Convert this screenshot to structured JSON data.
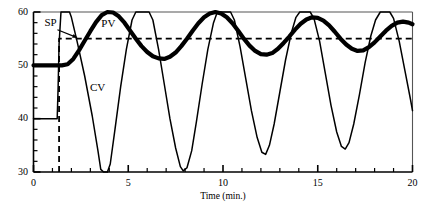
{
  "chart_data": {
    "type": "line",
    "title": "",
    "xlabel": "Time (min.)",
    "ylabel": "",
    "xlim": [
      0,
      20
    ],
    "ylim": [
      30,
      60
    ],
    "grid": false,
    "legend_position": "inline-annotations",
    "x_major_ticks": [
      0,
      5,
      10,
      15,
      20
    ],
    "x_major_tick_labels": [
      "0",
      "5",
      "10",
      "15",
      "20"
    ],
    "x_minor_tick_step": 1,
    "y_major_ticks": [
      30,
      40,
      50,
      60
    ],
    "y_major_tick_labels": [
      "30",
      "40",
      "50",
      "60"
    ],
    "y_minor_tick_step": 2,
    "annotations": [
      {
        "text": "SP",
        "x": 1.0,
        "y": 57.8,
        "arrow_to_x": 2.3,
        "arrow_to_y": 55.0
      },
      {
        "text": "PV",
        "x": 4.0,
        "y": 57.6
      },
      {
        "text": "CV",
        "x": 3.4,
        "y": 45.5
      }
    ],
    "series": [
      {
        "name": "SP",
        "style": "dashed",
        "width": 1.8,
        "color": "#000000",
        "points": [
          [
            1.35,
            30.0
          ],
          [
            1.35,
            55.0
          ],
          [
            20.0,
            55.0
          ]
        ]
      },
      {
        "name": "PV",
        "style": "solid-thick",
        "width": 4.2,
        "color": "#000000",
        "points": [
          [
            0.0,
            50.0
          ],
          [
            1.0,
            50.0
          ],
          [
            1.5,
            50.0
          ],
          [
            1.8,
            50.2
          ],
          [
            2.1,
            51.2
          ],
          [
            2.4,
            52.8
          ],
          [
            2.7,
            54.6
          ],
          [
            3.0,
            56.4
          ],
          [
            3.3,
            58.1
          ],
          [
            3.6,
            59.4
          ],
          [
            3.9,
            60.0
          ],
          [
            4.2,
            59.9
          ],
          [
            4.5,
            59.2
          ],
          [
            4.8,
            58.0
          ],
          [
            5.1,
            56.5
          ],
          [
            5.4,
            55.0
          ],
          [
            5.7,
            53.6
          ],
          [
            6.0,
            52.5
          ],
          [
            6.3,
            51.7
          ],
          [
            6.6,
            51.3
          ],
          [
            6.9,
            51.2
          ],
          [
            7.2,
            51.6
          ],
          [
            7.5,
            52.4
          ],
          [
            7.8,
            53.6
          ],
          [
            8.1,
            55.0
          ],
          [
            8.4,
            56.5
          ],
          [
            8.7,
            57.9
          ],
          [
            9.0,
            59.0
          ],
          [
            9.3,
            59.7
          ],
          [
            9.6,
            60.0
          ],
          [
            9.9,
            59.7
          ],
          [
            10.2,
            59.0
          ],
          [
            10.5,
            57.9
          ],
          [
            10.8,
            56.5
          ],
          [
            11.1,
            55.0
          ],
          [
            11.4,
            53.7
          ],
          [
            11.7,
            52.7
          ],
          [
            12.0,
            52.1
          ],
          [
            12.3,
            52.0
          ],
          [
            12.6,
            52.3
          ],
          [
            12.9,
            53.1
          ],
          [
            13.2,
            54.2
          ],
          [
            13.5,
            55.4
          ],
          [
            13.8,
            56.7
          ],
          [
            14.1,
            57.8
          ],
          [
            14.4,
            58.6
          ],
          [
            14.7,
            59.0
          ],
          [
            15.0,
            58.9
          ],
          [
            15.3,
            58.4
          ],
          [
            15.6,
            57.5
          ],
          [
            15.9,
            56.3
          ],
          [
            16.2,
            55.0
          ],
          [
            16.5,
            53.9
          ],
          [
            16.8,
            53.1
          ],
          [
            17.1,
            52.7
          ],
          [
            17.4,
            52.8
          ],
          [
            17.7,
            53.4
          ],
          [
            18.0,
            54.3
          ],
          [
            18.3,
            55.4
          ],
          [
            18.6,
            56.5
          ],
          [
            18.9,
            57.4
          ],
          [
            19.2,
            58.0
          ],
          [
            19.5,
            58.2
          ],
          [
            19.8,
            58.0
          ],
          [
            20.0,
            57.7
          ]
        ]
      },
      {
        "name": "CV",
        "style": "solid-thin",
        "width": 1.5,
        "color": "#000000",
        "points": [
          [
            0.0,
            40.0
          ],
          [
            1.25,
            40.0
          ],
          [
            1.3,
            46.0
          ],
          [
            1.35,
            54.0
          ],
          [
            1.45,
            60.0
          ],
          [
            1.9,
            60.0
          ],
          [
            2.0,
            59.0
          ],
          [
            2.3,
            54.5
          ],
          [
            2.7,
            48.0
          ],
          [
            3.1,
            40.5
          ],
          [
            3.4,
            34.0
          ],
          [
            3.55,
            30.5
          ],
          [
            3.7,
            30.0
          ],
          [
            3.9,
            30.0
          ],
          [
            4.05,
            31.5
          ],
          [
            4.3,
            38.0
          ],
          [
            4.6,
            46.0
          ],
          [
            4.9,
            53.0
          ],
          [
            5.2,
            58.5
          ],
          [
            5.4,
            60.0
          ],
          [
            6.1,
            60.0
          ],
          [
            6.3,
            58.5
          ],
          [
            6.6,
            53.0
          ],
          [
            6.9,
            46.5
          ],
          [
            7.2,
            40.0
          ],
          [
            7.5,
            34.5
          ],
          [
            7.75,
            31.0
          ],
          [
            7.9,
            30.2
          ],
          [
            8.1,
            30.8
          ],
          [
            8.35,
            34.0
          ],
          [
            8.6,
            39.5
          ],
          [
            8.9,
            46.5
          ],
          [
            9.2,
            53.0
          ],
          [
            9.5,
            58.0
          ],
          [
            9.7,
            60.0
          ],
          [
            10.4,
            60.0
          ],
          [
            10.6,
            58.5
          ],
          [
            10.9,
            53.5
          ],
          [
            11.2,
            47.5
          ],
          [
            11.5,
            41.5
          ],
          [
            11.8,
            36.5
          ],
          [
            12.05,
            33.7
          ],
          [
            12.25,
            33.3
          ],
          [
            12.45,
            35.0
          ],
          [
            12.7,
            39.0
          ],
          [
            13.0,
            45.0
          ],
          [
            13.3,
            51.0
          ],
          [
            13.6,
            56.0
          ],
          [
            13.85,
            59.0
          ],
          [
            14.05,
            60.0
          ],
          [
            14.6,
            60.0
          ],
          [
            14.8,
            58.8
          ],
          [
            15.1,
            54.5
          ],
          [
            15.4,
            48.5
          ],
          [
            15.7,
            42.5
          ],
          [
            16.0,
            37.5
          ],
          [
            16.25,
            34.8
          ],
          [
            16.45,
            34.3
          ],
          [
            16.65,
            35.5
          ],
          [
            16.9,
            39.0
          ],
          [
            17.2,
            44.5
          ],
          [
            17.5,
            50.5
          ],
          [
            17.8,
            55.5
          ],
          [
            18.05,
            58.5
          ],
          [
            18.3,
            60.0
          ],
          [
            18.8,
            60.0
          ],
          [
            19.0,
            58.8
          ],
          [
            19.3,
            54.5
          ],
          [
            19.6,
            49.0
          ],
          [
            19.9,
            43.5
          ],
          [
            20.0,
            41.5
          ]
        ]
      }
    ]
  },
  "plot_frame": {
    "top_border": true,
    "right_border": true,
    "left_axis": true,
    "bottom_axis": true
  }
}
